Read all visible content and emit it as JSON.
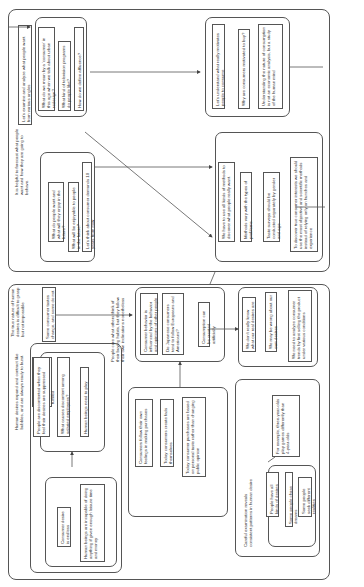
{
  "top_section": {
    "intro": "Let's examine and analyze what people want from various angles",
    "questions": [
      "What do we mean by a 'consumer' in this age when we talk about urban redesign?",
      "What kind of television programs do people like?",
      "How do we define affluence?"
    ],
    "forecast_note": "It is helpful to forecast what people want and how they are going to behave.",
    "future": [
      "What do people want and what will they enjoy in the future?",
      "What will be enjoyable to people in the future?",
      "Let's think about consumer demands 10 years from now"
    ],
    "motivation": [
      "Let's understand what really motivates people to consume",
      "Why are consumers motivated to buy?",
      "Understanding the nature of consumption is not an economic analysis, but a study of the human mind"
    ],
    "methods": [
      "We have to use all kinds of methods to discover what people really want.",
      "Methods vary with the types of problems.",
      "Taste surveys should be conducted separately by gender and age",
      "To discover true consumer interests we should use the most objective and scientific methods instead of relying only on hunches and experience"
    ]
  },
  "bottom_section": {
    "desires_note": "Human desires expand and contract like bubbles, and are always ready to burst.",
    "endless": "Human desires are endless; there are always more to be fulfilled",
    "desires_group": [
      "Consumer desire is endless",
      "Human beings are incapable of doing anything if given enough leisure time and money"
    ],
    "discontent_group": [
      "People are discontented when they feel their desires are suppressed",
      "What causes discontent among salaried employees?",
      "Human beings need to play"
    ],
    "true_nature": "The true nature of human desires is difficult to grasp but not impossible",
    "tastes_change": "Some consumer tastes change, and some do not",
    "influence_note": "People care what others think of their buying habits, but they follow their own inclinations nonetheless",
    "influence_group": [
      "Consumer behavior is influenced by the behavior and opinions of other people",
      "Do Japanese consumers tend to follow Europeans and Americans?",
      "Consumption can be created artificially"
    ],
    "feelings_group": [
      "Consumers follow their own feelings in making purchases",
      "Today consumers create fads themselves",
      "Today consumer purchases are based on personal taste rather than changing public opinion"
    ],
    "unknown_group": [
      "We don't really know what our real desires are",
      "We may be wrong about our own desires",
      "We need to analyze consumer trends by first selling the product under various conditions"
    ],
    "examination_note": "Careful examination reveals consistent patterns in human desire",
    "example": "For example, three-year-olds play games differently than 4-year-olds",
    "patterns_group": [
      "People have all kinds of desires",
      "Some people chase dreams",
      "Some people seek different realities"
    ]
  }
}
